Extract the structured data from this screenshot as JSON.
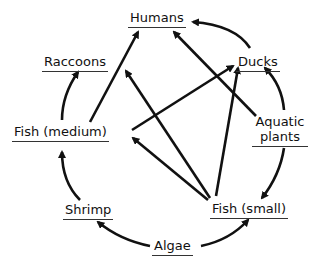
{
  "diagram": {
    "type": "food-web",
    "nodes": [
      {
        "id": "humans",
        "label": "Humans"
      },
      {
        "id": "raccoons",
        "label": "Raccoons"
      },
      {
        "id": "ducks",
        "label": "Ducks"
      },
      {
        "id": "fish_medium",
        "label": "Fish (medium)"
      },
      {
        "id": "aquatic_plants",
        "label": "Aquatic plants",
        "lines": [
          "Aquatic",
          "plants"
        ]
      },
      {
        "id": "shrimp",
        "label": "Shrimp"
      },
      {
        "id": "fish_small",
        "label": "Fish (small)"
      },
      {
        "id": "algae",
        "label": "Algae"
      }
    ],
    "edges": [
      {
        "from": "algae",
        "to": "shrimp"
      },
      {
        "from": "algae",
        "to": "fish_small"
      },
      {
        "from": "shrimp",
        "to": "fish_medium"
      },
      {
        "from": "fish_medium",
        "to": "raccoons"
      },
      {
        "from": "fish_medium",
        "to": "humans"
      },
      {
        "from": "fish_medium",
        "to": "ducks"
      },
      {
        "from": "fish_small",
        "to": "fish_medium"
      },
      {
        "from": "fish_small",
        "to": "raccoons"
      },
      {
        "from": "fish_small",
        "to": "ducks"
      },
      {
        "from": "aquatic_plants",
        "to": "ducks"
      },
      {
        "from": "aquatic_plants",
        "to": "humans"
      },
      {
        "from": "aquatic_plants",
        "to": "fish_small"
      },
      {
        "from": "ducks",
        "to": "humans"
      }
    ],
    "colors": {
      "ink": "#111111",
      "underline": "#333333",
      "background": "#ffffff"
    }
  }
}
